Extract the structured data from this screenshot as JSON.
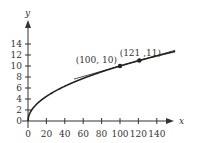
{
  "chart_data": {
    "type": "line",
    "title": "",
    "xlabel": "x",
    "ylabel": "y",
    "xlim": [
      0,
      160
    ],
    "ylim": [
      0,
      16
    ],
    "x_ticks": [
      0,
      20,
      40,
      60,
      80,
      100,
      120,
      140
    ],
    "y_ticks": [
      0,
      2,
      4,
      6,
      8,
      10,
      12,
      14
    ],
    "grid": false,
    "series": [
      {
        "name": "y = sqrt(x)",
        "kind": "curve",
        "x": [
          0,
          1,
          4,
          9,
          16,
          25,
          36,
          49,
          64,
          81,
          100,
          121,
          144,
          160
        ],
        "values": [
          0,
          1,
          2,
          3,
          4,
          5,
          6,
          7,
          8,
          9,
          10,
          11,
          12,
          12.65
        ]
      },
      {
        "name": "secant line",
        "kind": "line",
        "x": [
          50,
          160
        ],
        "values": [
          7.62,
          12.86
        ]
      }
    ],
    "points": [
      {
        "x": 100,
        "y": 10,
        "label": "(100, 10)"
      },
      {
        "x": 121,
        "y": 11,
        "label": "(121 ,11)"
      }
    ]
  },
  "colors": {
    "ink": "#333333",
    "background": "#ffffff"
  }
}
